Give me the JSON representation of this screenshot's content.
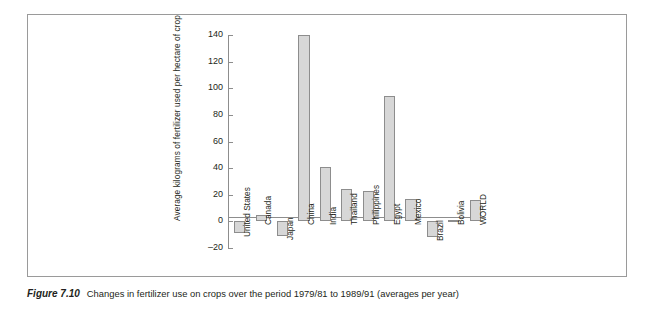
{
  "figure": {
    "number_label": "Figure 7.10",
    "caption": "Changes in fertilizer use on crops over the period 1979/81 to 1989/91 (averages per year)"
  },
  "chart_data": {
    "type": "bar",
    "title": "",
    "xlabel": "",
    "ylabel": "Average kilograms of fertilizer used per hectare of crop",
    "ylim": [
      -20,
      140
    ],
    "yticks": [
      -20,
      0,
      20,
      40,
      60,
      80,
      100,
      120,
      140
    ],
    "ytick_labels": [
      "–20",
      "0",
      "20",
      "40",
      "60",
      "80",
      "100",
      "120",
      "140"
    ],
    "grid": false,
    "legend": "none",
    "bar_fill_color": "#d7d7d7",
    "bar_edge_color": "#8d8d8d",
    "axis_color": "#8d8d8d",
    "categories": [
      "United States",
      "Canada",
      "Japan",
      "China",
      "India",
      "Thailand",
      "Philippines",
      "Egypt",
      "Mexico",
      "Brazil",
      "Bolivia",
      "WORLD"
    ],
    "values": [
      -9,
      5,
      -11,
      140,
      41,
      24,
      23,
      94,
      17,
      -12,
      1,
      16
    ]
  }
}
